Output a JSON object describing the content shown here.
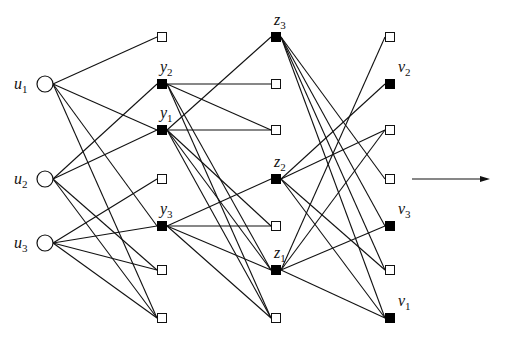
{
  "diagram": {
    "type": "layered-graph",
    "layers": [
      {
        "x": 45,
        "nodes": [
          {
            "id": "u1",
            "y": 84,
            "shape": "circle",
            "label": "u",
            "sub": "1"
          },
          {
            "id": "u2",
            "y": 179,
            "shape": "circle",
            "label": "u",
            "sub": "2"
          },
          {
            "id": "u3",
            "y": 243,
            "shape": "circle",
            "label": "u",
            "sub": "3"
          }
        ]
      },
      {
        "x": 162,
        "nodes": [
          {
            "id": "a1",
            "y": 37,
            "shape": "open"
          },
          {
            "id": "y2",
            "y": 84,
            "shape": "filled",
            "label": "y",
            "sub": "2"
          },
          {
            "id": "y1",
            "y": 130,
            "shape": "filled",
            "label": "y",
            "sub": "1"
          },
          {
            "id": "a4",
            "y": 179,
            "shape": "open"
          },
          {
            "id": "y3",
            "y": 226,
            "shape": "filled",
            "label": "y",
            "sub": "3"
          },
          {
            "id": "a6",
            "y": 270,
            "shape": "open"
          },
          {
            "id": "a7",
            "y": 318,
            "shape": "open"
          }
        ]
      },
      {
        "x": 276,
        "nodes": [
          {
            "id": "z3",
            "y": 37,
            "shape": "filled",
            "label": "z",
            "sub": "3"
          },
          {
            "id": "b2",
            "y": 84,
            "shape": "open"
          },
          {
            "id": "b3",
            "y": 130,
            "shape": "open"
          },
          {
            "id": "z2",
            "y": 179,
            "shape": "filled",
            "label": "z",
            "sub": "2"
          },
          {
            "id": "b5",
            "y": 226,
            "shape": "open"
          },
          {
            "id": "z1",
            "y": 270,
            "shape": "filled",
            "label": "z",
            "sub": "1"
          },
          {
            "id": "b7",
            "y": 318,
            "shape": "open"
          }
        ]
      },
      {
        "x": 390,
        "nodes": [
          {
            "id": "c1",
            "y": 37,
            "shape": "open"
          },
          {
            "id": "v2",
            "y": 84,
            "shape": "filled",
            "label": "v",
            "sub": "2"
          },
          {
            "id": "c3",
            "y": 130,
            "shape": "open"
          },
          {
            "id": "c4",
            "y": 179,
            "shape": "open"
          },
          {
            "id": "v3",
            "y": 226,
            "shape": "filled",
            "label": "v",
            "sub": "3"
          },
          {
            "id": "c6",
            "y": 270,
            "shape": "open"
          },
          {
            "id": "v1",
            "y": 318,
            "shape": "filled",
            "label": "v",
            "sub": "1"
          }
        ]
      }
    ],
    "edges": [
      [
        "u1",
        "a1"
      ],
      [
        "u1",
        "y1"
      ],
      [
        "u1",
        "y3"
      ],
      [
        "u1",
        "a7"
      ],
      [
        "u2",
        "y2"
      ],
      [
        "u2",
        "y1"
      ],
      [
        "u2",
        "a6"
      ],
      [
        "u2",
        "a7"
      ],
      [
        "u3",
        "a4"
      ],
      [
        "u3",
        "y3"
      ],
      [
        "u3",
        "a6"
      ],
      [
        "u3",
        "a7"
      ],
      [
        "y2",
        "b2"
      ],
      [
        "y2",
        "b3"
      ],
      [
        "y2",
        "z1"
      ],
      [
        "y2",
        "b7"
      ],
      [
        "y1",
        "z3"
      ],
      [
        "y1",
        "b3"
      ],
      [
        "y1",
        "b5"
      ],
      [
        "y1",
        "z1"
      ],
      [
        "y1",
        "b7"
      ],
      [
        "y3",
        "z2"
      ],
      [
        "y3",
        "b5"
      ],
      [
        "y3",
        "z1"
      ],
      [
        "y3",
        "b7"
      ],
      [
        "z3",
        "c4"
      ],
      [
        "z3",
        "v3"
      ],
      [
        "z3",
        "c6"
      ],
      [
        "z3",
        "v1"
      ],
      [
        "z2",
        "v2"
      ],
      [
        "z2",
        "c3"
      ],
      [
        "z2",
        "c6"
      ],
      [
        "z2",
        "v1"
      ],
      [
        "z1",
        "c1"
      ],
      [
        "z1",
        "c3"
      ],
      [
        "z1",
        "v3"
      ],
      [
        "z1",
        "v1"
      ]
    ],
    "arrow": {
      "x1": 412,
      "y1": 179,
      "x2": 490,
      "y2": 179
    }
  }
}
